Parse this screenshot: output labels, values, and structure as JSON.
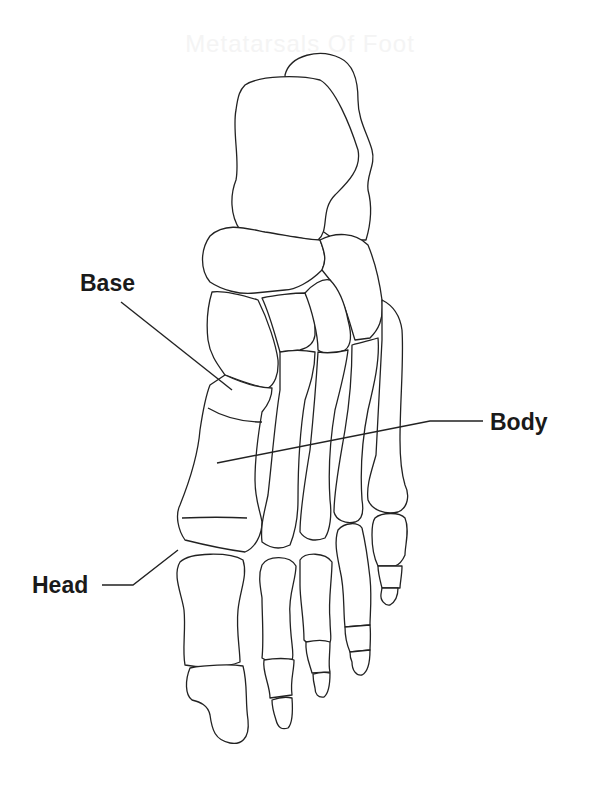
{
  "diagram": {
    "title_faded": "Metatarsals Of Foot",
    "labels": {
      "base": "Base",
      "body": "Body",
      "head": "Head"
    },
    "colors": {
      "background": "#ffffff",
      "outline": "#222222",
      "label_text": "#1a1a1a"
    }
  }
}
